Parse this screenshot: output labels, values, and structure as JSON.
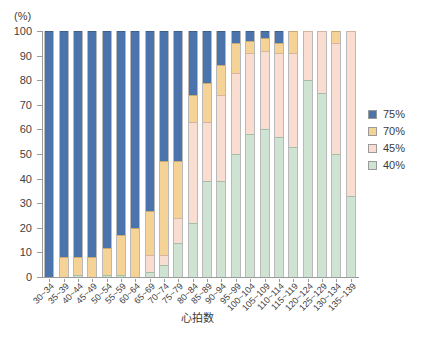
{
  "chart_data": {
    "type": "bar",
    "stacked": true,
    "stack_mode": "percent",
    "title": "",
    "subtitle": "",
    "xlabel": "心拍数",
    "ylabel": "",
    "y_unit": "(%)",
    "ylim": [
      0,
      100
    ],
    "yticks": [
      0,
      10,
      20,
      30,
      40,
      50,
      60,
      70,
      80,
      90,
      100
    ],
    "grid": false,
    "legend_position": "right",
    "categories": [
      "30~34",
      "35~39",
      "40~44",
      "45~49",
      "50~54",
      "55~59",
      "60~64",
      "65~69",
      "70~74",
      "75~79",
      "80~84",
      "85~89",
      "90~94",
      "95~99",
      "100~104",
      "105~109",
      "110~114",
      "115~119",
      "120~124",
      "125~129",
      "130~134",
      "135~139"
    ],
    "series": [
      {
        "name": "40%",
        "color": "#cfe3d2",
        "values": [
          0,
          0,
          1,
          0,
          1,
          1,
          0,
          2,
          5,
          14,
          22,
          39,
          39,
          50,
          58,
          60,
          57,
          53,
          80,
          75,
          50,
          33
        ]
      },
      {
        "name": "45%",
        "color": "#f9ddd1",
        "values": [
          0,
          0,
          0,
          0,
          0,
          0,
          0,
          7,
          4,
          10,
          41,
          24,
          35,
          33,
          33,
          32,
          34,
          38,
          20,
          25,
          45,
          67
        ]
      },
      {
        "name": "70%",
        "color": "#f5d396",
        "values": [
          0,
          8,
          7,
          8,
          11,
          16,
          20,
          18,
          38,
          23,
          11,
          16,
          12,
          12,
          5,
          5,
          4,
          9,
          0,
          0,
          5,
          0
        ]
      },
      {
        "name": "75%",
        "color": "#4a74ab",
        "values": [
          100,
          92,
          92,
          92,
          88,
          83,
          80,
          73,
          53,
          53,
          26,
          21,
          14,
          5,
          4,
          3,
          5,
          0,
          0,
          0,
          0,
          0
        ]
      }
    ],
    "legend": [
      {
        "label": "75%",
        "color": "#4a74ab"
      },
      {
        "label": "70%",
        "color": "#f5d396"
      },
      {
        "label": "45%",
        "color": "#f9ddd1"
      },
      {
        "label": "40%",
        "color": "#cfe3d2"
      }
    ]
  }
}
